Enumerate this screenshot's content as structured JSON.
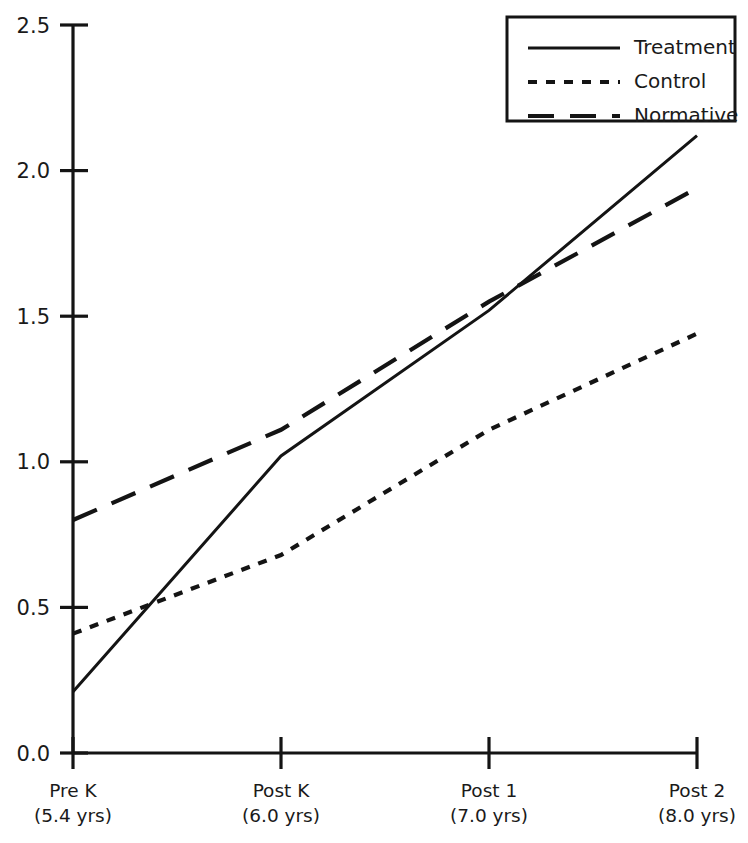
{
  "chart_data": {
    "type": "line",
    "title": "",
    "xlabel": "",
    "ylabel": "",
    "categories": [
      "Pre K",
      "Post K",
      "Post 1",
      "Post 2"
    ],
    "category_sublabels": [
      "(5.4 yrs)",
      "(6.0 yrs)",
      "(7.0 yrs)",
      "(8.0 yrs)"
    ],
    "x": [
      5.4,
      6.0,
      7.0,
      8.0
    ],
    "ylim": [
      0.0,
      2.5
    ],
    "yticks": [
      0.0,
      0.5,
      1.0,
      1.5,
      2.0,
      2.5
    ],
    "ytick_labels": [
      "0.0",
      "0.5",
      "1.0",
      "1.5",
      "2.0",
      "2.5"
    ],
    "grid": false,
    "legend_position": "top-right",
    "series": [
      {
        "name": "Treatment",
        "style": "solid",
        "values": [
          0.21,
          1.02,
          1.52,
          2.12
        ]
      },
      {
        "name": "Control",
        "style": "dotted",
        "values": [
          0.41,
          0.68,
          1.11,
          1.44
        ]
      },
      {
        "name": "Normative",
        "style": "dashed",
        "values": [
          0.8,
          1.11,
          1.55,
          1.94
        ]
      }
    ]
  },
  "legend": {
    "entries": [
      {
        "label": "Treatment",
        "style": "solid"
      },
      {
        "label": "Control",
        "style": "dotted"
      },
      {
        "label": "Normative",
        "style": "dashed"
      }
    ]
  },
  "colors": {
    "ink": "#141414",
    "background": "#ffffff"
  }
}
